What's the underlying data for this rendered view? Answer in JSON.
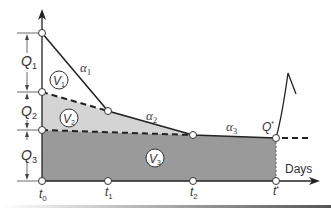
{
  "diagram": {
    "colors": {
      "light_fill": "#d4d4d4",
      "dark_fill": "#9a9a9a",
      "line": "#222222",
      "background": "#ffffff"
    },
    "vertical_labels": [
      {
        "main": "Q",
        "sub": "1"
      },
      {
        "main": "Q",
        "sub": "2"
      },
      {
        "main": "Q",
        "sub": "3"
      }
    ],
    "time_labels": [
      {
        "main": "t",
        "sub": "0"
      },
      {
        "main": "t",
        "sub": "1"
      },
      {
        "main": "t",
        "sub": "2"
      },
      {
        "main": "t",
        "sup": "*"
      }
    ],
    "slope_labels": [
      {
        "main": "α",
        "sub": "1"
      },
      {
        "main": "α",
        "sub": "2"
      },
      {
        "main": "α",
        "sub": "3"
      }
    ],
    "volume_labels": [
      {
        "main": "V",
        "sub": "1"
      },
      {
        "main": "V",
        "sub": "2"
      },
      {
        "main": "V",
        "sub": "3"
      }
    ],
    "q_star": {
      "main": "Q",
      "sup": "*"
    },
    "x_axis_label": "Days"
  }
}
